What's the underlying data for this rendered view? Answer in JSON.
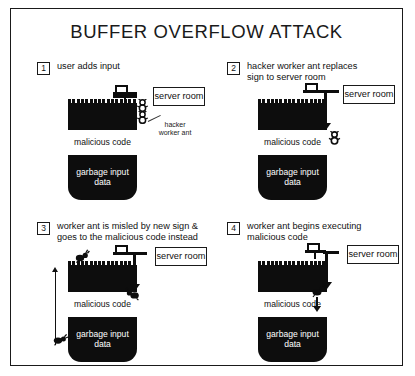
{
  "title": "BUFFER OVERFLOW ATTACK",
  "buffer_labels": {
    "malicious": "malicious\ncode",
    "garbage": "garbage\ninput data"
  },
  "server_room_label": "server\nroom",
  "annotation": {
    "hacker_ant": "hacker\nworker ant"
  },
  "panels": [
    {
      "number": "1",
      "caption": "user adds input",
      "icons": {
        "sign": "signpost-icon",
        "ant": "ant-icon"
      }
    },
    {
      "number": "2",
      "caption": "hacker worker ant replaces\nsign to server room",
      "icons": {
        "sign": "signpost-icon",
        "ant": "ant-icon",
        "pipe": "redirect-arrow-icon"
      }
    },
    {
      "number": "3",
      "caption": "worker ant is misled by new sign &\ngoes to the malicious code instead",
      "icons": {
        "sign": "signpost-icon",
        "ant": "ant-icon",
        "pipe": "redirect-arrow-icon",
        "arrow": "arrow-up-icon"
      }
    },
    {
      "number": "4",
      "caption": "worker ant begins executing\nmalicious code",
      "icons": {
        "sign": "signpost-icon",
        "ant": "ant-icon",
        "pipe": "redirect-arrow-icon",
        "arrow": "arrow-down-icon"
      }
    }
  ],
  "colors": {
    "ink": "#1a1a1a",
    "fill_black": "#0d0d0d",
    "paper": "#ffffff"
  }
}
